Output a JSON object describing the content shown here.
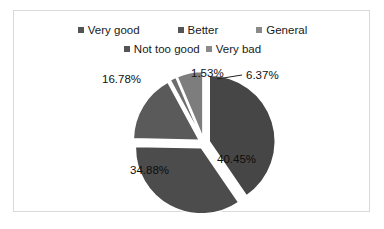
{
  "chart_data": {
    "type": "pie",
    "title": "",
    "categories": [
      "Very good",
      "Better",
      "General",
      "Not too good",
      "Very bad"
    ],
    "values": [
      40.45,
      34.88,
      16.78,
      1.53,
      6.37
    ],
    "value_labels": [
      "40.45%",
      "34.88%",
      "16.78%",
      "1.53%",
      "6.37%"
    ],
    "units": "percent",
    "exploded": true,
    "start_angle_deg": 0,
    "direction": "clockwise",
    "legend_position": "top",
    "grid": false,
    "colors": [
      "#464646",
      "#4c4c4c",
      "#5a5a5a",
      "#6e6e6e",
      "#7d7d7d"
    ]
  },
  "legend": {
    "rows": [
      [
        {
          "label": "Very good",
          "color": "#545454",
          "marker": "square-marker"
        },
        {
          "label": "Better",
          "color": "#545454",
          "marker": "square-marker"
        },
        {
          "label": "General",
          "color": "#8a8a8a",
          "marker": "square-marker"
        }
      ],
      [
        {
          "label": "Not too good",
          "color": "#545454",
          "marker": "square-marker"
        },
        {
          "label": "Very bad",
          "color": "#8a8a8a",
          "marker": "square-marker"
        }
      ]
    ]
  },
  "labels": {
    "veryGood": "40.45%",
    "better": "34.88%",
    "general": "16.78%",
    "notTooGood": "1.53%",
    "veryBad": "6.37%"
  }
}
